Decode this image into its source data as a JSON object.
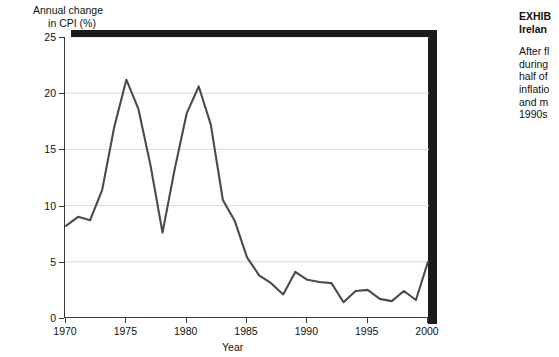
{
  "axis": {
    "y_title_line1": "Annual change",
    "y_title_line2": "in CPI (%)",
    "x_title": "Year",
    "y_ticks": [
      "0",
      "5",
      "10",
      "15",
      "20",
      "25"
    ],
    "x_ticks": [
      "1970",
      "1975",
      "1980",
      "1985",
      "1990",
      "1995",
      "2000"
    ]
  },
  "caption": {
    "exhibit_label": "EXHIB",
    "subtitle": "Irelan",
    "body_lines": [
      "After fl",
      "during ",
      "half of ",
      "inflatio",
      "and m",
      "1990s"
    ]
  },
  "colors": {
    "line": "#4a4a4a",
    "shadow": "#1b1b1b",
    "grid": "#d8d8d8",
    "axis": "#3a3a3a"
  },
  "chart_data": {
    "type": "line",
    "title": "",
    "xlabel": "Year",
    "ylabel": "Annual change in CPI (%)",
    "xlim": [
      1970,
      2000
    ],
    "ylim": [
      0,
      25
    ],
    "grid": true,
    "legend": "none",
    "x": [
      1970,
      1971,
      1972,
      1973,
      1974,
      1975,
      1976,
      1977,
      1978,
      1979,
      1980,
      1981,
      1982,
      1983,
      1984,
      1985,
      1986,
      1987,
      1988,
      1989,
      1990,
      1991,
      1992,
      1993,
      1994,
      1995,
      1996,
      1997,
      1998,
      1999,
      2000
    ],
    "values": [
      8.2,
      9.0,
      8.7,
      11.4,
      17.0,
      21.2,
      18.6,
      13.6,
      7.6,
      13.2,
      18.2,
      20.6,
      17.2,
      10.5,
      8.6,
      5.4,
      3.8,
      3.1,
      2.1,
      4.1,
      3.4,
      3.2,
      3.1,
      1.4,
      2.4,
      2.5,
      1.7,
      1.5,
      2.4,
      1.6,
      5.0
    ]
  }
}
